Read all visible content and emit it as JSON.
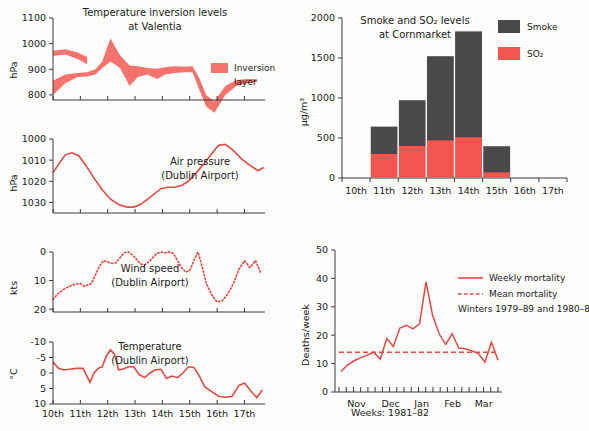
{
  "figure": {
    "panels": [
      "temperature-inversion",
      "air-pressure",
      "wind-speed",
      "temperature",
      "smoke-so2",
      "mortality"
    ]
  },
  "chart_data": [
    {
      "id": "temperature-inversion",
      "type": "area",
      "title_line1": "Temperature inversion levels",
      "title_line2": "at Valentia",
      "ylabel": "hPa",
      "ylim": [
        1100,
        780
      ],
      "yticks": [
        800,
        900,
        1000,
        1100
      ],
      "ytick_labels": [
        "800",
        "900",
        "1000",
        "1100"
      ],
      "xlim": [
        10,
        17.75
      ],
      "xticks": [
        10,
        11,
        12,
        13,
        14,
        15,
        16,
        17
      ],
      "grid": false,
      "legend": {
        "label_line1": "Inversion",
        "label_line2": "layer",
        "color": "#F4736C",
        "position": "inside-right"
      },
      "band_color": "#F4736C",
      "x": [
        10.0,
        10.45,
        10.9,
        11.25,
        11.55,
        11.8,
        12.1,
        12.45,
        12.8,
        13.1,
        13.45,
        13.8,
        14.1,
        14.45,
        14.8,
        15.1,
        15.35,
        15.6,
        15.9,
        16.3,
        16.7,
        17.1,
        17.45
      ],
      "upper": [
        800,
        845,
        870,
        872,
        880,
        905,
        930,
        905,
        835,
        870,
        880,
        862,
        880,
        885,
        888,
        888,
        820,
        755,
        730,
        800,
        835,
        845,
        850
      ],
      "lower": [
        855,
        880,
        885,
        888,
        900,
        930,
        1020,
        955,
        915,
        912,
        905,
        902,
        908,
        912,
        910,
        912,
        865,
        800,
        775,
        835,
        858,
        862,
        862
      ],
      "lower_segment2_x": [
        10.0,
        10.45,
        10.9,
        11.25
      ],
      "lower_segment2_upper": [
        952,
        958,
        940,
        920
      ],
      "lower_segment2_lower": [
        972,
        978,
        965,
        948
      ]
    },
    {
      "id": "air-pressure",
      "type": "line",
      "title_line1": "Air pressure",
      "title_line2": "(Dublin Airport)",
      "ylabel": "hPa",
      "ylim": [
        1000,
        1035
      ],
      "yticks": [
        1000,
        1010,
        1020,
        1030
      ],
      "ytick_labels": [
        "1000",
        "1010",
        "1020",
        "1030"
      ],
      "xlim": [
        10,
        17.75
      ],
      "xticks": [
        10,
        11,
        12,
        13,
        14,
        15,
        16,
        17
      ],
      "line_color": "#E04A45",
      "x": [
        10.0,
        10.2,
        10.45,
        10.7,
        10.95,
        11.2,
        11.5,
        11.8,
        12.1,
        12.4,
        12.7,
        12.95,
        13.2,
        13.45,
        13.7,
        13.95,
        14.2,
        14.45,
        14.7,
        14.95,
        15.2,
        15.5,
        15.8,
        16.05,
        16.3,
        16.6,
        16.9,
        17.2,
        17.5,
        17.7
      ],
      "y": [
        1016.0,
        1012.0,
        1007.5,
        1006.5,
        1008.0,
        1012.5,
        1018.5,
        1024.0,
        1028.5,
        1031.0,
        1032.2,
        1032.2,
        1031.0,
        1028.5,
        1026.0,
        1023.5,
        1022.8,
        1022.8,
        1022.0,
        1020.0,
        1016.5,
        1012.0,
        1007.0,
        1003.0,
        1002.5,
        1005.5,
        1009.5,
        1012.5,
        1015.0,
        1013.5
      ]
    },
    {
      "id": "wind-speed",
      "type": "line",
      "line_style": "dotted",
      "title_line1": "Wind speed",
      "title_line2": "(Dublin Airport)",
      "ylabel": "kts",
      "ylim": [
        0,
        21
      ],
      "yticks": [
        0,
        10,
        20
      ],
      "ytick_labels": [
        "0",
        "10",
        "20"
      ],
      "xlim": [
        10,
        17.75
      ],
      "xticks": [
        10,
        11,
        12,
        13,
        14,
        15,
        16,
        17
      ],
      "line_color": "#E04A45",
      "x": [
        10.0,
        10.2,
        10.4,
        10.6,
        10.8,
        11.0,
        11.15,
        11.3,
        11.4,
        11.55,
        11.7,
        11.85,
        12.0,
        12.15,
        12.3,
        12.45,
        12.6,
        12.75,
        12.9,
        13.05,
        13.2,
        13.35,
        13.5,
        13.65,
        13.8,
        13.95,
        14.1,
        14.25,
        14.4,
        14.55,
        14.7,
        14.85,
        15.0,
        15.15,
        15.3,
        15.45,
        15.6,
        15.8,
        16.0,
        16.2,
        16.4,
        16.6,
        16.8,
        17.0,
        17.2,
        17.4,
        17.6
      ],
      "y": [
        16.5,
        14.5,
        13.0,
        12.0,
        11.3,
        11.0,
        12.0,
        11.5,
        11.0,
        8.0,
        5.0,
        3.0,
        3.5,
        4.0,
        3.8,
        2.0,
        0.2,
        0.0,
        1.0,
        2.5,
        4.2,
        4.5,
        3.5,
        2.0,
        0.5,
        0.0,
        0.3,
        0.0,
        0.5,
        3.0,
        5.5,
        7.0,
        6.5,
        3.0,
        0.0,
        5.0,
        11.0,
        15.0,
        17.5,
        17.0,
        14.5,
        11.0,
        6.0,
        3.0,
        5.5,
        3.0,
        7.5
      ]
    },
    {
      "id": "temperature",
      "type": "line",
      "title_line1": "Temperature",
      "title_line2": "(Dublin Airport)",
      "ylabel": "°C",
      "ylim": [
        -10,
        10
      ],
      "yticks": [
        -10,
        -5,
        0,
        5,
        10
      ],
      "ytick_labels": [
        "-10",
        "-5",
        "0",
        "5",
        "10"
      ],
      "xlim": [
        10,
        17.75
      ],
      "xticks": [
        10,
        11,
        12,
        13,
        14,
        15,
        16,
        17
      ],
      "xtick_labels": [
        "10th",
        "11th",
        "12th",
        "13th",
        "14th",
        "15th",
        "16th",
        "17th"
      ],
      "line_color": "#E04A45",
      "x": [
        10.0,
        10.2,
        10.4,
        10.6,
        10.85,
        11.1,
        11.35,
        11.5,
        11.65,
        11.8,
        11.95,
        12.1,
        12.25,
        12.4,
        12.55,
        12.75,
        12.95,
        13.15,
        13.35,
        13.55,
        13.75,
        13.95,
        14.15,
        14.35,
        14.55,
        14.75,
        14.95,
        15.15,
        15.35,
        15.55,
        15.8,
        16.05,
        16.3,
        16.55,
        16.8,
        17.0,
        17.2,
        17.45,
        17.65
      ],
      "y": [
        -3.5,
        -1.5,
        -1.0,
        -1.2,
        -1.5,
        -1.5,
        3.0,
        0.0,
        -1.5,
        -2.0,
        -5.5,
        -7.5,
        -6.0,
        -1.0,
        -1.2,
        -2.0,
        -2.0,
        0.5,
        1.5,
        0.0,
        -1.0,
        -1.2,
        1.8,
        1.0,
        1.5,
        0.0,
        -2.0,
        -1.8,
        1.0,
        4.5,
        6.0,
        7.5,
        7.8,
        7.5,
        4.0,
        3.2,
        5.5,
        8.0,
        5.5
      ]
    },
    {
      "id": "smoke-so2",
      "type": "bar",
      "stacked": true,
      "title_line1": "Smoke and SO₂ levels",
      "title_line2": "at Cornmarket",
      "ylabel": "µg/m³",
      "ylim": [
        0,
        2000
      ],
      "yticks": [
        0,
        500,
        1000,
        1500,
        2000
      ],
      "ytick_labels": [
        "0",
        "500",
        "1000",
        "1500",
        "2000"
      ],
      "categories": [
        "10th",
        "11th",
        "12th",
        "13th",
        "14th",
        "15th",
        "16th",
        "17th"
      ],
      "series": [
        {
          "name": "SO₂",
          "color": "#F4564F",
          "values": [
            0,
            300,
            400,
            470,
            510,
            70,
            0,
            0
          ]
        },
        {
          "name": "Smoke",
          "color": "#4A4A4A",
          "values": [
            0,
            350,
            580,
            1060,
            1330,
            335,
            0,
            0
          ]
        }
      ],
      "totals": [
        0,
        650,
        980,
        1530,
        1840,
        405,
        0,
        0
      ],
      "legend": {
        "position": "right",
        "entries": [
          "Smoke",
          "SO₂"
        ]
      }
    },
    {
      "id": "mortality",
      "type": "line",
      "ylabel": "Deaths/week",
      "xlabel": "Weeks: 1981–82",
      "ylim": [
        0,
        50
      ],
      "yticks": [
        0,
        10,
        20,
        30,
        40,
        50
      ],
      "ytick_labels": [
        "0",
        "10",
        "20",
        "30",
        "40",
        "50"
      ],
      "xtick_labels": [
        "Nov",
        "Dec",
        "Jan",
        "Feb",
        "Mar"
      ],
      "n_weeks": 22,
      "line_color": "#E04A45",
      "mean_value": 14,
      "legend": {
        "weekly_label": "Weekly mortality",
        "mean_label": "Mean mortality",
        "note": "Winters 1979–89 and 1980–81"
      },
      "weekly_values": [
        7.2,
        9.5,
        11.0,
        12.0,
        13.0,
        14.0,
        11.5,
        18.8,
        16.0,
        22.5,
        23.5,
        22.2,
        24.0,
        38.8,
        27.0,
        20.5,
        16.8,
        20.5,
        15.5,
        15.2,
        14.5,
        13.5,
        10.5,
        17.5,
        11.2
      ]
    }
  ]
}
